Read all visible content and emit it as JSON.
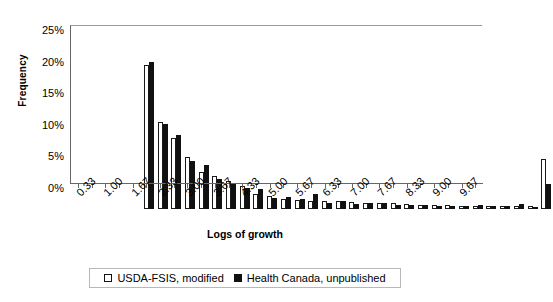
{
  "chart_data": {
    "type": "bar",
    "title": "",
    "xlabel": "Logs of growth",
    "ylabel": "Frequency",
    "ylim": [
      0,
      25
    ],
    "ytick_labels": [
      "0%",
      "5%",
      "10%",
      "15%",
      "20%",
      "25%"
    ],
    "ytick_values": [
      0,
      5,
      10,
      15,
      20,
      25
    ],
    "grid": false,
    "legend_position": "bottom",
    "bar_style": {
      "series0_fill": "#ffffff",
      "series0_edge": "#1a1a1a",
      "series1_fill": "#111111",
      "series1_edge": "#111111"
    },
    "categories": [
      "0.33",
      "0.67",
      "1.00",
      "1.33",
      "1.67",
      "2.00",
      "2.33",
      "2.67",
      "3.00",
      "3.33",
      "3.67",
      "4.00",
      "4.33",
      "4.67",
      "5.00",
      "5.33",
      "5.67",
      "6.00",
      "6.33",
      "6.67",
      "7.00",
      "7.33",
      "7.67",
      "8.00",
      "8.33",
      "8.67",
      "9.00",
      "9.33",
      "9.67",
      "More"
    ],
    "tick_labels_shown": [
      "0.33",
      "1.00",
      "1.67",
      "2.33",
      "3.00",
      "3.67",
      "4.33",
      "5.00",
      "5.67",
      "6.33",
      "7.00",
      "7.67",
      "8.33",
      "9.00",
      "9.67"
    ],
    "series": [
      {
        "name": "USDA-FSIS, modified",
        "values": [
          22.8,
          13.8,
          11.2,
          8.2,
          5.8,
          5.3,
          4.4,
          3.6,
          2.4,
          2.0,
          1.6,
          1.5,
          1.2,
          1.2,
          1.3,
          1.1,
          1.0,
          0.9,
          0.9,
          0.8,
          0.7,
          0.7,
          0.6,
          0.5,
          0.5,
          0.5,
          0.4,
          0.4,
          0.4,
          7.9
        ]
      },
      {
        "name": "Health Canada, unpublished",
        "values": [
          23.2,
          13.5,
          11.7,
          7.6,
          6.9,
          4.7,
          4.0,
          3.3,
          3.2,
          1.8,
          1.9,
          1.6,
          2.4,
          1.0,
          1.2,
          0.8,
          1.0,
          0.9,
          0.7,
          0.6,
          0.6,
          0.5,
          0.5,
          0.4,
          0.6,
          0.4,
          0.4,
          0.8,
          0.3,
          4.0
        ]
      }
    ]
  },
  "legend": {
    "items": [
      {
        "label": "USDA-FSIS, modified",
        "swatch": "hollow-square"
      },
      {
        "label": "Health Canada, unpublished",
        "swatch": "filled-square"
      }
    ]
  }
}
